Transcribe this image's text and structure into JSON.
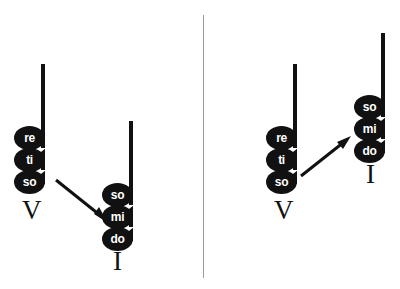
{
  "figure": {
    "background_color": "#ffffff",
    "ink_color": "#111111",
    "divider_color": "#9a9a9a",
    "notehead_text_color": "#ffffff"
  },
  "divider": {
    "label": "panel-divider"
  },
  "panels": [
    {
      "id": "left-panel",
      "name": "wide-leap-resolution",
      "chords": [
        {
          "id": "left-v-chord",
          "numeral": "V",
          "notes": [
            {
              "syllable": "re"
            },
            {
              "syllable": "ti"
            },
            {
              "syllable": "so"
            }
          ]
        },
        {
          "id": "left-i-chord",
          "numeral": "I",
          "notes": [
            {
              "syllable": "so"
            },
            {
              "syllable": "mi"
            },
            {
              "syllable": "do"
            }
          ]
        }
      ],
      "arrow": {
        "id": "left-arrow",
        "direction": "down-right"
      }
    },
    {
      "id": "right-panel",
      "name": "close-step-resolution",
      "chords": [
        {
          "id": "right-v-chord",
          "numeral": "V",
          "notes": [
            {
              "syllable": "re"
            },
            {
              "syllable": "ti"
            },
            {
              "syllable": "so"
            }
          ]
        },
        {
          "id": "right-i-chord",
          "numeral": "I",
          "notes": [
            {
              "syllable": "so"
            },
            {
              "syllable": "mi"
            },
            {
              "syllable": "do"
            }
          ]
        }
      ],
      "arrow": {
        "id": "right-arrow",
        "direction": "up-right"
      }
    }
  ]
}
